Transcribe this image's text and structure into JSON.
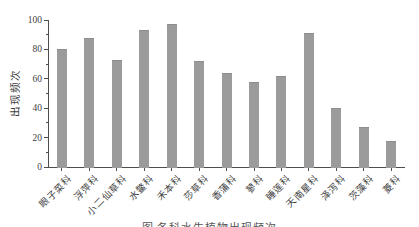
{
  "figure": {
    "caption_partial": "图 各科水生植物出现频次"
  },
  "chart_data": {
    "type": "bar",
    "title": "",
    "categories": [
      "眼子菜科",
      "浮萍科",
      "小二仙草科",
      "水鳖科",
      "禾本科",
      "莎草科",
      "香蒲科",
      "蓼科",
      "睡莲科",
      "天南星科",
      "泽泻科",
      "茨藻科",
      "菱科"
    ],
    "values": [
      80,
      88,
      73,
      93,
      97,
      72,
      64,
      58,
      62,
      91,
      40,
      27,
      18
    ],
    "xlabel": "",
    "ylabel": "出现频次",
    "ylim": [
      0,
      100
    ],
    "yticks_major": [
      0,
      20,
      40,
      60,
      80,
      100
    ],
    "yticks_minor": [
      10,
      30,
      50,
      70,
      90
    ],
    "grid": false,
    "legend": "none",
    "bar_color": "#9b9b9b",
    "axis_color": "#4d4d4d",
    "text_color": "#3f3f3f"
  }
}
